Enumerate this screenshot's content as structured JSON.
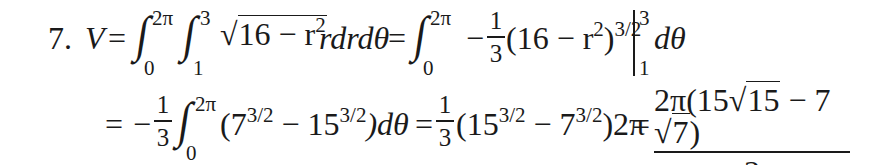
{
  "problem": {
    "number": "7.",
    "line1": {
      "lhs_var": "V",
      "eq1": "=",
      "int_outer": {
        "symbol": "∫",
        "lower": "0",
        "upper": "2π"
      },
      "int_inner": {
        "symbol": "∫",
        "lower": "1",
        "upper": "3"
      },
      "radical_sign": "√",
      "radicand": "16 − r",
      "radicand_exp": "2",
      "integrand_tail": "rdrdθ",
      "eq2": "=",
      "int_rhs": {
        "symbol": "∫",
        "lower": "0",
        "upper": "2π"
      },
      "minus": "−",
      "frac": {
        "num": "1",
        "den": "3"
      },
      "antideriv": "(16 − r",
      "antideriv_exp_inner": "2",
      "antideriv_close": ")",
      "antideriv_exp": "3/2",
      "eval_upper": "3",
      "eval_lower": "1",
      "dtheta": "dθ"
    },
    "line2": {
      "eq1": "=",
      "minus": "−",
      "frac1": {
        "num": "1",
        "den": "3"
      },
      "int": {
        "symbol": "∫",
        "lower": "0",
        "upper": "2π"
      },
      "open": "(7",
      "exp_a": "3/2",
      "mid": " − 15",
      "exp_b": "3/2",
      "close": ")dθ",
      "eq2": "=",
      "frac2": {
        "num": "1",
        "den": "3"
      },
      "open2": "(15",
      "exp_c": "3/2",
      "mid2": " − 7",
      "exp_d": "3/2",
      "close2": ")2π",
      "eq3": "=",
      "result": {
        "num_prefix": "2π(15",
        "sqrt1": "15",
        "num_mid": " − 7",
        "sqrt2": "7",
        "num_suffix": ")",
        "den": "3"
      }
    }
  }
}
